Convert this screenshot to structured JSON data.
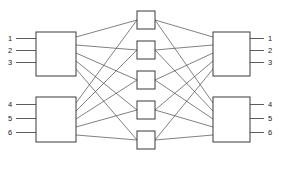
{
  "diagram": {
    "type": "clos-network",
    "background_color": "#ffffff",
    "line_color": "#4a4a4a",
    "box_stroke_color": "#3a3a3a",
    "box_fill_color": "#ffffff",
    "label_color": "#1a1a1a"
  },
  "inputs": {
    "top": [
      {
        "label": "1",
        "x": 8,
        "y": 41,
        "line_y": 38.5,
        "line_x1": 16,
        "line_x2": 36
      },
      {
        "label": "2",
        "x": 8,
        "y": 53,
        "line_y": 50.5,
        "line_x1": 16,
        "line_x2": 36
      },
      {
        "label": "3",
        "x": 8,
        "y": 65,
        "line_y": 62.5,
        "line_x1": 16,
        "line_x2": 36
      }
    ],
    "bottom": [
      {
        "label": "4",
        "x": 8,
        "y": 107,
        "line_y": 104.5,
        "line_x1": 16,
        "line_x2": 36
      },
      {
        "label": "5",
        "x": 8,
        "y": 121,
        "line_y": 118.5,
        "line_x1": 16,
        "line_x2": 36
      },
      {
        "label": "6",
        "x": 8,
        "y": 135,
        "line_y": 132.5,
        "line_x1": 16,
        "line_x2": 36
      }
    ]
  },
  "outputs": {
    "top": [
      {
        "label": "1",
        "x": 268,
        "y": 41,
        "line_y": 38.5,
        "line_x1": 250,
        "line_x2": 264
      },
      {
        "label": "2",
        "x": 268,
        "y": 53,
        "line_y": 50.5,
        "line_x1": 250,
        "line_x2": 264
      },
      {
        "label": "3",
        "x": 268,
        "y": 65,
        "line_y": 62.5,
        "line_x1": 250,
        "line_x2": 264
      }
    ],
    "bottom": [
      {
        "label": "4",
        "x": 268,
        "y": 107,
        "line_y": 104.5,
        "line_x1": 250,
        "line_x2": 264
      },
      {
        "label": "5",
        "x": 268,
        "y": 121,
        "line_y": 118.5,
        "line_x1": 250,
        "line_x2": 264
      },
      {
        "label": "6",
        "x": 268,
        "y": 135,
        "line_y": 132.5,
        "line_x1": 250,
        "line_x2": 264
      }
    ]
  },
  "ingress_switches": [
    {
      "id": "ingress-1",
      "x": 36,
      "y": 32,
      "w": 40,
      "h": 44
    },
    {
      "id": "ingress-2",
      "x": 36,
      "y": 97,
      "w": 40,
      "h": 45
    }
  ],
  "middle_switches": [
    {
      "id": "middle-1",
      "x": 137,
      "y": 11,
      "w": 18,
      "h": 18
    },
    {
      "id": "middle-2",
      "x": 137,
      "y": 41,
      "w": 18,
      "h": 18
    },
    {
      "id": "middle-3",
      "x": 137,
      "y": 71,
      "w": 18,
      "h": 18
    },
    {
      "id": "middle-4",
      "x": 137,
      "y": 101,
      "w": 18,
      "h": 18
    },
    {
      "id": "middle-5",
      "x": 137,
      "y": 131,
      "w": 18,
      "h": 18
    }
  ],
  "egress_switches": [
    {
      "id": "egress-1",
      "x": 213,
      "y": 32,
      "w": 37,
      "h": 44
    },
    {
      "id": "egress-2",
      "x": 213,
      "y": 97,
      "w": 37,
      "h": 45
    }
  ],
  "stage1_links": [
    {
      "from": "ingress-1",
      "to": "middle-1",
      "x1": 76,
      "y1": 37,
      "x2": 137,
      "y2": 20
    },
    {
      "from": "ingress-1",
      "to": "middle-2",
      "x1": 76,
      "y1": 45,
      "x2": 137,
      "y2": 50
    },
    {
      "from": "ingress-1",
      "to": "middle-3",
      "x1": 76,
      "y1": 53,
      "x2": 137,
      "y2": 80
    },
    {
      "from": "ingress-1",
      "to": "middle-4",
      "x1": 76,
      "y1": 61,
      "x2": 137,
      "y2": 110
    },
    {
      "from": "ingress-1",
      "to": "middle-5",
      "x1": 76,
      "y1": 69,
      "x2": 137,
      "y2": 140
    },
    {
      "from": "ingress-2",
      "to": "middle-1",
      "x1": 76,
      "y1": 103,
      "x2": 137,
      "y2": 20
    },
    {
      "from": "ingress-2",
      "to": "middle-2",
      "x1": 76,
      "y1": 111,
      "x2": 137,
      "y2": 50
    },
    {
      "from": "ingress-2",
      "to": "middle-3",
      "x1": 76,
      "y1": 119,
      "x2": 137,
      "y2": 80
    },
    {
      "from": "ingress-2",
      "to": "middle-4",
      "x1": 76,
      "y1": 127,
      "x2": 137,
      "y2": 110
    },
    {
      "from": "ingress-2",
      "to": "middle-5",
      "x1": 76,
      "y1": 135,
      "x2": 137,
      "y2": 140
    }
  ],
  "stage2_links": [
    {
      "from": "middle-1",
      "to": "egress-1",
      "x1": 155,
      "y1": 20,
      "x2": 213,
      "y2": 37
    },
    {
      "from": "middle-2",
      "to": "egress-1",
      "x1": 155,
      "y1": 50,
      "x2": 213,
      "y2": 45
    },
    {
      "from": "middle-3",
      "to": "egress-1",
      "x1": 155,
      "y1": 80,
      "x2": 213,
      "y2": 53
    },
    {
      "from": "middle-4",
      "to": "egress-1",
      "x1": 155,
      "y1": 110,
      "x2": 213,
      "y2": 61
    },
    {
      "from": "middle-5",
      "to": "egress-1",
      "x1": 155,
      "y1": 140,
      "x2": 213,
      "y2": 69
    },
    {
      "from": "middle-1",
      "to": "egress-2",
      "x1": 155,
      "y1": 20,
      "x2": 213,
      "y2": 103
    },
    {
      "from": "middle-2",
      "to": "egress-2",
      "x1": 155,
      "y1": 50,
      "x2": 213,
      "y2": 111
    },
    {
      "from": "middle-3",
      "to": "egress-2",
      "x1": 155,
      "y1": 80,
      "x2": 213,
      "y2": 119
    },
    {
      "from": "middle-4",
      "to": "egress-2",
      "x1": 155,
      "y1": 110,
      "x2": 213,
      "y2": 127
    },
    {
      "from": "middle-5",
      "to": "egress-2",
      "x1": 155,
      "y1": 140,
      "x2": 213,
      "y2": 135
    }
  ]
}
